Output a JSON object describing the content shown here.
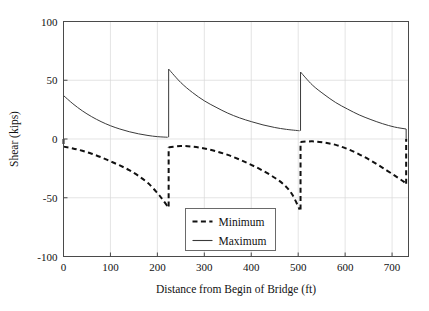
{
  "chart_data": {
    "type": "line",
    "title": "",
    "xlabel": "Distance from Begin of Bridge (ft)",
    "ylabel": "Shear (kips)",
    "xlim": [
      0,
      735
    ],
    "ylim": [
      -100,
      100
    ],
    "xticks": [
      0,
      100,
      200,
      300,
      400,
      500,
      600,
      700
    ],
    "yticks": [
      100,
      50,
      0,
      -50,
      -100
    ],
    "xtick_labels": [
      "0",
      "100",
      "200",
      "300",
      "400",
      "500",
      "600",
      "700"
    ],
    "ytick_labels": [
      "100",
      "50",
      "0",
      "-50",
      "-100"
    ],
    "grid": true,
    "legend_position": "bottom-center",
    "spans": [
      [
        0,
        222
      ],
      [
        224,
        503
      ],
      [
        505,
        730
      ]
    ],
    "series": [
      {
        "name": "Minimum",
        "style": "dashed",
        "color": "#111111",
        "segments": [
          [
            [
              0,
              -6.5
            ],
            [
              20,
              -8.0
            ],
            [
              40,
              -10.0
            ],
            [
              60,
              -12.5
            ],
            [
              80,
              -15.5
            ],
            [
              100,
              -19.0
            ],
            [
              120,
              -22.5
            ],
            [
              140,
              -26.5
            ],
            [
              160,
              -31.5
            ],
            [
              180,
              -37.5
            ],
            [
              200,
              -46.0
            ],
            [
              212,
              -52.0
            ],
            [
              222,
              -57.5
            ]
          ],
          [
            [
              224,
              -7.0
            ],
            [
              250,
              -6.0
            ],
            [
              275,
              -6.5
            ],
            [
              300,
              -8.0
            ],
            [
              325,
              -10.5
            ],
            [
              350,
              -13.5
            ],
            [
              375,
              -17.5
            ],
            [
              400,
              -22.0
            ],
            [
              425,
              -27.0
            ],
            [
              450,
              -33.0
            ],
            [
              470,
              -39.0
            ],
            [
              487,
              -47.0
            ],
            [
              503,
              -60.0
            ]
          ],
          [
            [
              505,
              -2.5
            ],
            [
              530,
              -2.0
            ],
            [
              555,
              -3.0
            ],
            [
              580,
              -5.0
            ],
            [
              605,
              -8.5
            ],
            [
              630,
              -13.0
            ],
            [
              655,
              -18.5
            ],
            [
              680,
              -24.5
            ],
            [
              705,
              -31.0
            ],
            [
              722,
              -35.5
            ],
            [
              730,
              -38.0
            ]
          ]
        ]
      },
      {
        "name": "Maximum",
        "style": "solid",
        "color": "#3a3a3a",
        "segments": [
          [
            [
              0,
              37.0
            ],
            [
              20,
              30.0
            ],
            [
              40,
              24.0
            ],
            [
              60,
              19.0
            ],
            [
              80,
              14.8
            ],
            [
              100,
              11.3
            ],
            [
              120,
              8.5
            ],
            [
              140,
              6.2
            ],
            [
              160,
              4.4
            ],
            [
              180,
              3.0
            ],
            [
              200,
              2.0
            ],
            [
              222,
              1.5
            ]
          ],
          [
            [
              224,
              59.5
            ],
            [
              250,
              48.0
            ],
            [
              275,
              39.5
            ],
            [
              300,
              32.5
            ],
            [
              325,
              27.0
            ],
            [
              350,
              22.0
            ],
            [
              375,
              18.0
            ],
            [
              400,
              14.8
            ],
            [
              425,
              12.0
            ],
            [
              450,
              9.8
            ],
            [
              475,
              8.2
            ],
            [
              503,
              7.0
            ]
          ],
          [
            [
              505,
              57.0
            ],
            [
              530,
              46.0
            ],
            [
              555,
              38.0
            ],
            [
              580,
              31.0
            ],
            [
              605,
              25.5
            ],
            [
              630,
              20.5
            ],
            [
              655,
              16.5
            ],
            [
              680,
              13.0
            ],
            [
              705,
              10.2
            ],
            [
              730,
              8.5
            ]
          ]
        ]
      }
    ],
    "legend": {
      "entries": [
        {
          "label": "Minimum",
          "style": "dashed"
        },
        {
          "label": "Maximum",
          "style": "solid"
        }
      ]
    }
  }
}
